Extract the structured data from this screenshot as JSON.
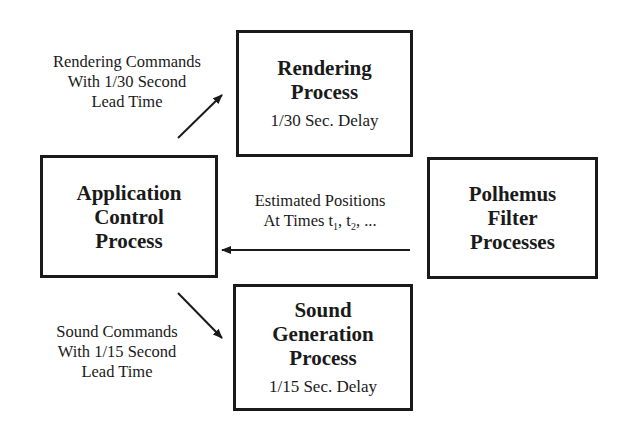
{
  "diagram": {
    "nodes": {
      "rendering": {
        "title_lines": [
          "Rendering",
          "Process"
        ],
        "subtitle": "1/30 Sec. Delay"
      },
      "application": {
        "title_lines": [
          "Application",
          "Control",
          "Process"
        ]
      },
      "polhemus": {
        "title_lines": [
          "Polhemus",
          "Filter",
          "Processes"
        ]
      },
      "sound": {
        "title_lines": [
          "Sound",
          "Generation",
          "Process"
        ],
        "subtitle": "1/15 Sec. Delay"
      }
    },
    "edges": {
      "to_rendering": {
        "from": "Application Control Process",
        "to": "Rendering Process",
        "label_lines": [
          "Rendering Commands",
          "With 1/30 Second",
          "Lead Time"
        ]
      },
      "from_polhemus": {
        "from": "Polhemus Filter Processes",
        "to": "Application Control Process",
        "label_line1": "Estimated Positions",
        "label_line2_prefix": "At Times t",
        "sub1": "1",
        "sep": ", t",
        "sub2": "2",
        "suffix": ", ..."
      },
      "to_sound": {
        "from": "Application Control Process",
        "to": "Sound Generation Process",
        "label_lines": [
          "Sound Commands",
          "With 1/15 Second",
          "Lead Time"
        ]
      }
    }
  }
}
